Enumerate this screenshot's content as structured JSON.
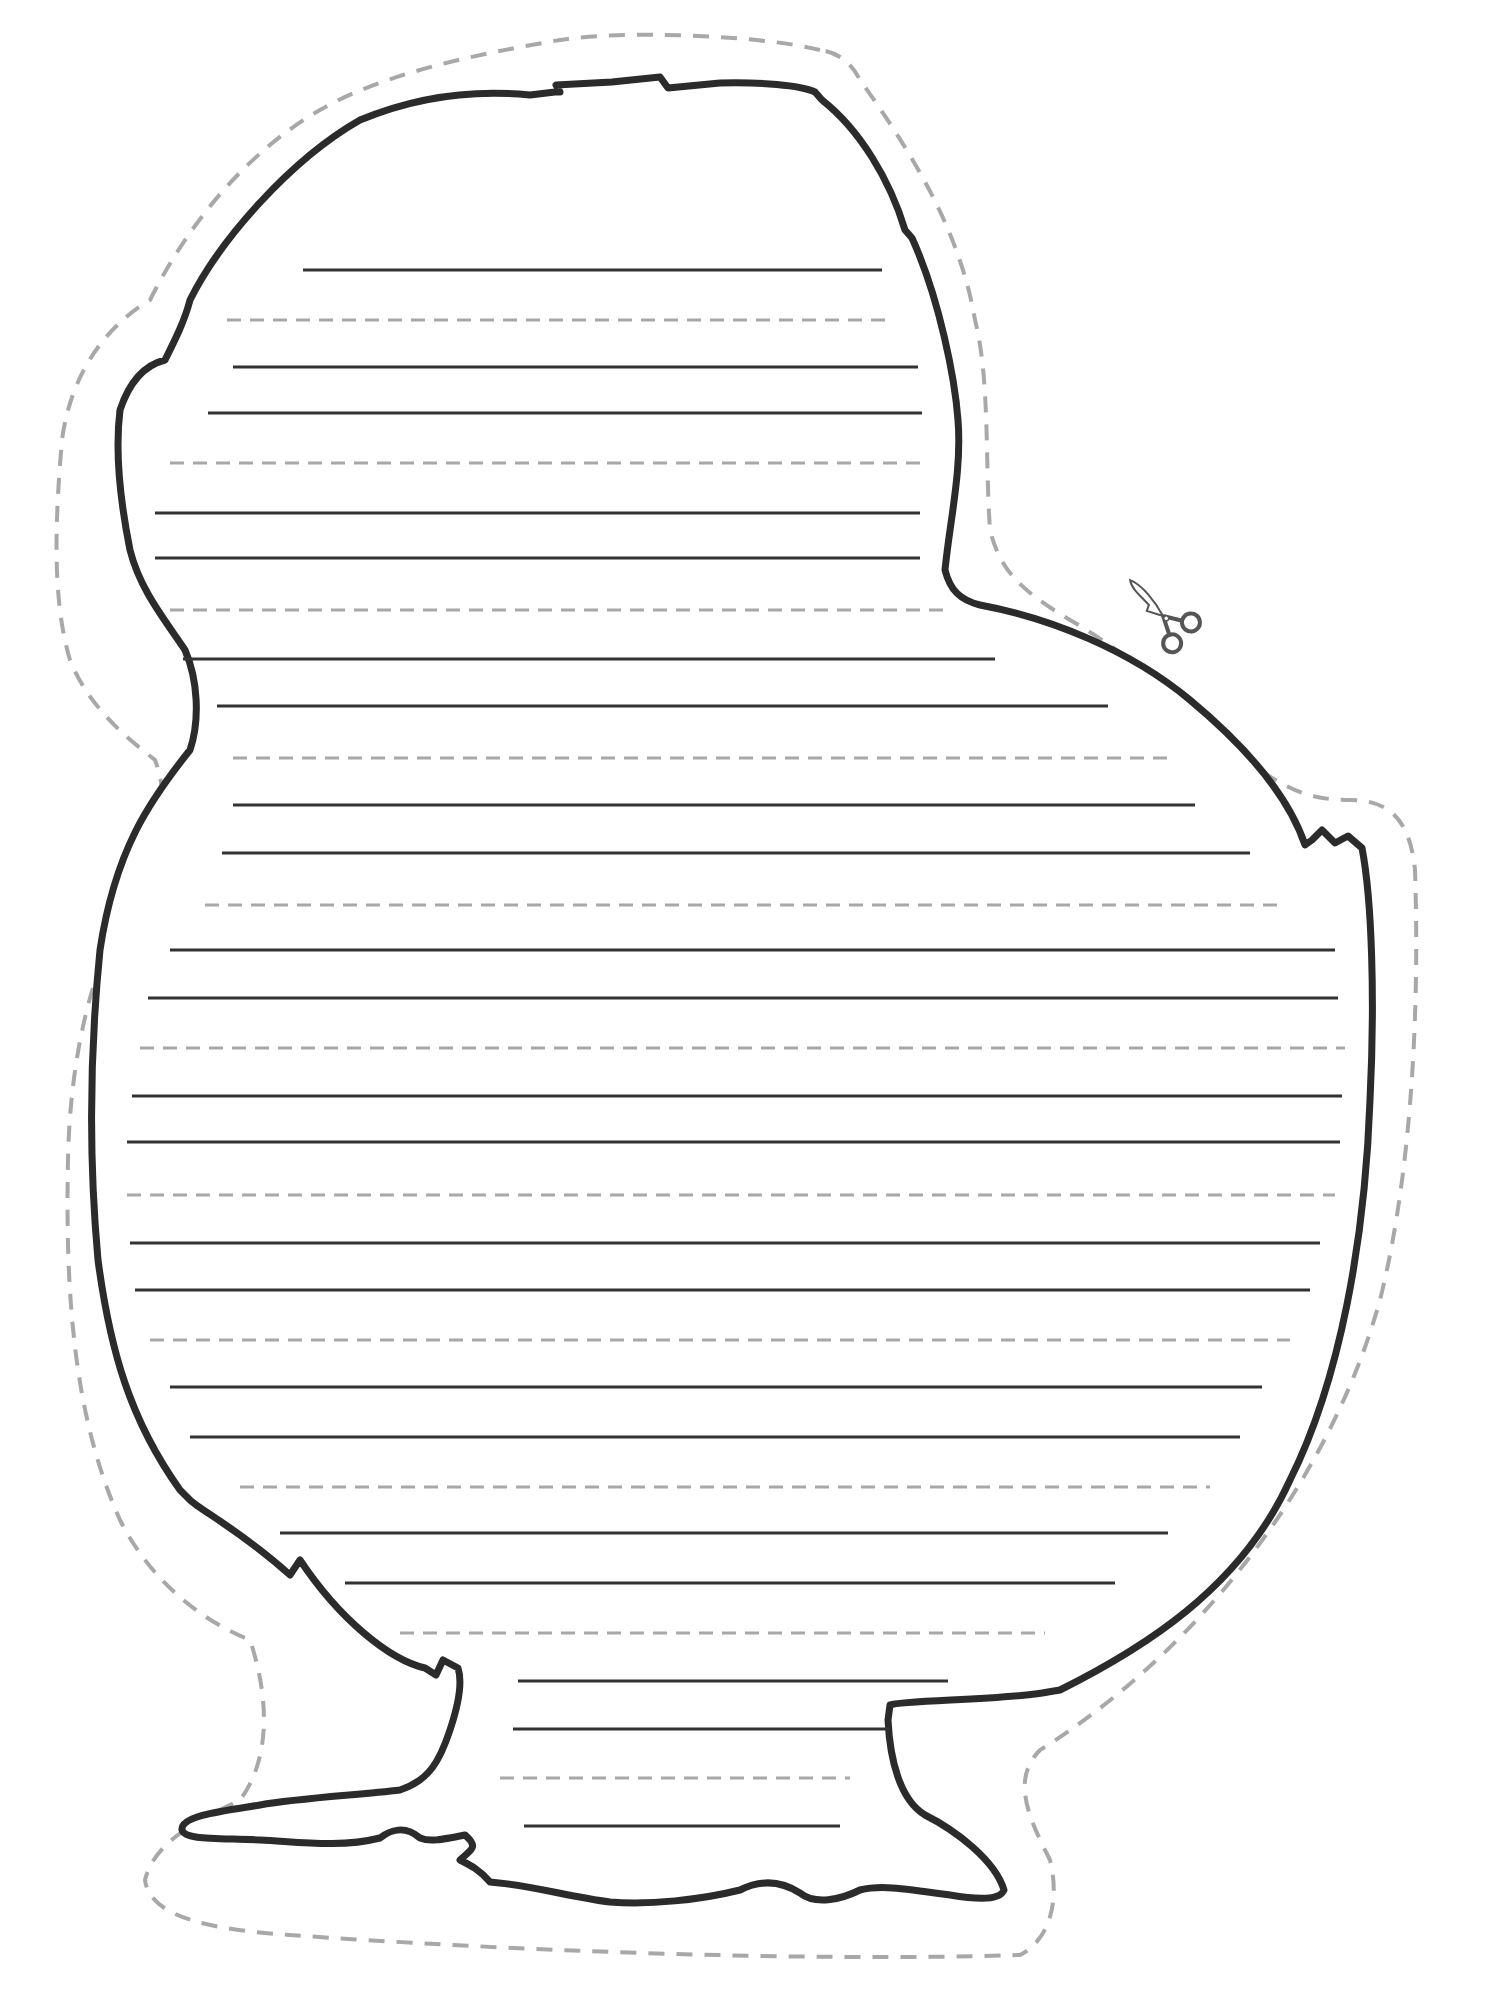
{
  "page": {
    "width": 1489,
    "height": 1990,
    "background": "#ffffff"
  },
  "colors": {
    "outline": "#2b2b2b",
    "solid_line": "#333333",
    "dashed_line": "#a8a8a8",
    "cut_line": "#a8a8a8",
    "scissors": "#555555"
  },
  "icons": {
    "scissors": {
      "name": "scissors-icon",
      "x": 1165,
      "y": 620,
      "rotation": 38
    }
  },
  "cut_line_path": "M 820 50 C 760 35 620 30 560 40 C 470 55 380 75 320 110 C 250 150 190 220 150 300 C 100 330 70 380 62 440 C 55 520 52 600 70 660 C 90 710 130 740 155 760 C 170 800 165 850 130 900 C 90 970 70 1060 68 1160 C 65 1300 75 1420 120 1520 C 150 1580 200 1620 250 1640 C 270 1700 270 1760 240 1800 C 200 1820 155 1840 145 1880 C 150 1920 220 1930 290 1935 C 500 1950 800 1962 1020 1955 C 1050 1940 1060 1900 1050 1860 C 1030 1820 1010 1780 1040 1750 C 1200 1650 1330 1480 1380 1300 C 1410 1180 1420 1020 1415 870 C 1410 820 1390 800 1350 800 C 1310 800 1290 790 1260 770 C 1200 720 1140 660 1070 620 C 1020 590 1000 570 990 530 C 985 460 990 380 975 320 C 960 230 910 150 860 80 C 850 60 835 52 820 50 Z",
  "outline_path": "M 560 92 L 556 85 L 612 82 L 660 77 L 668 88 L 720 83 C 760 82 800 85 815 92 L 822 100 C 860 130 890 180 905 230 L 912 238 C 940 300 955 380 958 420 C 962 470 950 520 945 570 C 950 590 960 600 980 605 C 1050 618 1130 650 1190 700 C 1250 750 1290 800 1305 845 L 1312 840 L 1322 830 L 1335 843 L 1348 836 L 1362 848 C 1372 900 1375 1000 1370 1100 C 1365 1240 1340 1380 1290 1480 C 1240 1590 1140 1650 1060 1690 L 1048 1692 C 1010 1700 900 1700 890 1705 L 888 1720 C 890 1760 900 1800 925 1815 C 955 1830 995 1860 1004 1890 C 1000 1900 980 1900 950 1895 C 900 1888 880 1885 860 1890 C 840 1900 815 1905 800 1893 C 780 1880 760 1880 740 1890 C 700 1900 650 1905 610 1902 C 570 1897 530 1885 490 1882 C 480 1870 470 1865 460 1860 C 470 1850 480 1848 465 1835 C 440 1840 430 1842 420 1838 C 405 1825 390 1830 380 1838 C 340 1848 300 1842 260 1840 C 215 1838 185 1840 182 1830 C 180 1815 230 1810 260 1805 C 300 1798 360 1795 400 1790 C 430 1780 440 1760 450 1730 C 460 1700 462 1680 458 1668 L 443 1660 L 436 1675 L 425 1668 C 390 1660 340 1620 300 1560 L 290 1575 C 240 1530 200 1510 190 1500 L 180 1490 C 130 1420 110 1350 98 1260 C 88 1150 90 1050 100 950 C 115 850 150 800 190 750 C 200 720 198 680 185 650 C 165 620 140 590 130 550 C 120 500 115 450 120 410 C 130 380 145 365 165 360 C 175 340 185 320 190 300 C 220 240 290 160 360 120 C 420 95 480 90 530 95 L 555 92 Z",
  "ruled_lines": [
    {
      "type": "solid",
      "y": 270,
      "x1": 303,
      "x2": 882
    },
    {
      "type": "dashed",
      "y": 320,
      "x1": 227,
      "x2": 890
    },
    {
      "type": "solid",
      "y": 367,
      "x1": 233,
      "x2": 918
    },
    {
      "type": "solid",
      "y": 413,
      "x1": 208,
      "x2": 922
    },
    {
      "type": "dashed",
      "y": 463,
      "x1": 170,
      "x2": 920
    },
    {
      "type": "solid",
      "y": 513,
      "x1": 155,
      "x2": 920
    },
    {
      "type": "solid",
      "y": 558,
      "x1": 155,
      "x2": 920
    },
    {
      "type": "dashed",
      "y": 610,
      "x1": 170,
      "x2": 950
    },
    {
      "type": "solid",
      "y": 659,
      "x1": 183,
      "x2": 995
    },
    {
      "type": "solid",
      "y": 706,
      "x1": 217,
      "x2": 1108
    },
    {
      "type": "dashed",
      "y": 758,
      "x1": 233,
      "x2": 1170
    },
    {
      "type": "solid",
      "y": 805,
      "x1": 233,
      "x2": 1195
    },
    {
      "type": "solid",
      "y": 853,
      "x1": 222,
      "x2": 1250
    },
    {
      "type": "dashed",
      "y": 905,
      "x1": 205,
      "x2": 1278
    },
    {
      "type": "solid",
      "y": 950,
      "x1": 170,
      "x2": 1335
    },
    {
      "type": "solid",
      "y": 998,
      "x1": 148,
      "x2": 1338
    },
    {
      "type": "dashed",
      "y": 1048,
      "x1": 140,
      "x2": 1345
    },
    {
      "type": "solid",
      "y": 1096,
      "x1": 132,
      "x2": 1342
    },
    {
      "type": "solid",
      "y": 1142,
      "x1": 127,
      "x2": 1340
    },
    {
      "type": "dashed",
      "y": 1195,
      "x1": 127,
      "x2": 1335
    },
    {
      "type": "solid",
      "y": 1243,
      "x1": 130,
      "x2": 1320
    },
    {
      "type": "solid",
      "y": 1290,
      "x1": 135,
      "x2": 1310
    },
    {
      "type": "dashed",
      "y": 1340,
      "x1": 150,
      "x2": 1290
    },
    {
      "type": "solid",
      "y": 1387,
      "x1": 170,
      "x2": 1262
    },
    {
      "type": "solid",
      "y": 1437,
      "x1": 190,
      "x2": 1240
    },
    {
      "type": "dashed",
      "y": 1487,
      "x1": 240,
      "x2": 1210
    },
    {
      "type": "solid",
      "y": 1533,
      "x1": 280,
      "x2": 1168
    },
    {
      "type": "solid",
      "y": 1583,
      "x1": 345,
      "x2": 1115
    },
    {
      "type": "dashed",
      "y": 1633,
      "x1": 400,
      "x2": 1045
    },
    {
      "type": "solid",
      "y": 1681,
      "x1": 518,
      "x2": 948
    },
    {
      "type": "solid",
      "y": 1729,
      "x1": 513,
      "x2": 890
    },
    {
      "type": "dashed",
      "y": 1778,
      "x1": 500,
      "x2": 850
    },
    {
      "type": "solid",
      "y": 1826,
      "x1": 524,
      "x2": 840
    }
  ]
}
